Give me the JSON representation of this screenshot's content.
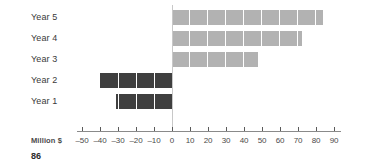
{
  "chart_data": {
    "type": "bar",
    "orientation": "horizontal",
    "title": "",
    "xlabel": "Million $",
    "ylabel": "",
    "categories": [
      "Year 1",
      "Year 2",
      "Year 3",
      "Year 4",
      "Year 5"
    ],
    "values": [
      -31,
      -40,
      48,
      72,
      84
    ],
    "xlim": [
      -55,
      95
    ],
    "xticks": [
      -50,
      -40,
      -30,
      -20,
      -10,
      0,
      10,
      20,
      30,
      40,
      50,
      60,
      70,
      80,
      90
    ],
    "xticklabels": [
      "–50",
      "–40",
      "–30",
      "–20",
      "–10",
      "0",
      "10",
      "20",
      "30",
      "40",
      "50",
      "60",
      "70",
      "80",
      "90"
    ],
    "grid": false,
    "legend": false,
    "segment_unit": 10,
    "colors": {
      "positive_bar": "#b2b2b2",
      "negative_bar": "#3f3f3f",
      "segment_divider": "#ffffff",
      "zero_line": "#c8c8c8",
      "axis_line": "#8a8a8a",
      "tick": "#5a5a5a",
      "label_text": "#3a3a3a"
    }
  },
  "axis": {
    "unit_label": "Million $"
  },
  "footer": {
    "page_number": "86"
  }
}
